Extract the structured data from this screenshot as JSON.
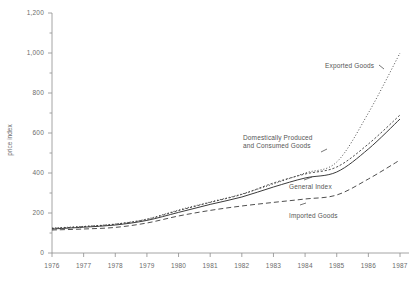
{
  "chart_data": {
    "type": "line",
    "title": "",
    "xlabel": "",
    "ylabel": "price index",
    "xlim": [
      1976,
      1987
    ],
    "ylim": [
      0,
      1200
    ],
    "grid": false,
    "legend_position": "inline-annotations",
    "x": [
      1976,
      1977,
      1978,
      1979,
      1980,
      1981,
      1982,
      1983,
      1984,
      1985,
      1986,
      1987
    ],
    "xtick_labels": [
      "1976",
      "1977",
      "1978",
      "1979",
      "1980",
      "1981",
      "1982",
      "1983",
      "1984",
      "1985",
      "1986",
      "1987"
    ],
    "ytick_labels": [
      "0",
      "200",
      "400",
      "600",
      "800",
      "1,000",
      "1,200"
    ],
    "ytick_values": [
      0,
      200,
      400,
      600,
      800,
      1000,
      1200
    ],
    "yminor_step": 100,
    "series": [
      {
        "name": "Exported Goods",
        "style": "dotted",
        "label_x": 1985.05,
        "label_y": 900,
        "values": [
          125,
          133,
          145,
          170,
          215,
          255,
          295,
          345,
          400,
          455,
          700,
          1000
        ]
      },
      {
        "name": "Domestically Produced and Consumed Goods",
        "style": "dashed-fine",
        "label_x": 1981.1,
        "label_y": 470,
        "values": [
          123,
          132,
          144,
          168,
          212,
          253,
          293,
          350,
          395,
          430,
          545,
          690
        ]
      },
      {
        "name": "General Index",
        "style": "solid",
        "label_x": 1982.6,
        "label_y": 315,
        "values": [
          120,
          129,
          140,
          163,
          203,
          243,
          280,
          330,
          375,
          405,
          520,
          670
        ]
      },
      {
        "name": "Imported Goods",
        "style": "dashed",
        "label_x": 1982.6,
        "label_y": 195,
        "values": [
          115,
          120,
          128,
          150,
          185,
          213,
          235,
          253,
          270,
          290,
          370,
          465
        ]
      }
    ],
    "annotations": [
      {
        "text_lines": [
          "Domestically Produced",
          "and Consumed Goods"
        ],
        "target_series": "Domestically Produced and Consumed Goods"
      },
      {
        "text_lines": [
          "Exported Goods"
        ],
        "target_series": "Exported Goods"
      },
      {
        "text_lines": [
          "General Index"
        ],
        "target_series": "General Index"
      },
      {
        "text_lines": [
          "Imported Goods"
        ],
        "target_series": "Imported Goods"
      }
    ]
  },
  "axis": {
    "y_title": "price index",
    "y_labels": [
      "1,200",
      "1,000",
      "800",
      "600",
      "400",
      "200",
      "0"
    ],
    "x_labels": [
      "1976",
      "1977",
      "1978",
      "1979",
      "1980",
      "1981",
      "1982",
      "1983",
      "1984",
      "1985",
      "1986",
      "1987"
    ]
  },
  "labels": {
    "exported_goods": "Exported Goods",
    "domestic_line1": "Domestically Produced",
    "domestic_line2": "and Consumed Goods",
    "general_index": "General Index",
    "imported_goods": "Imported Goods"
  },
  "colors": {
    "axis": "#8d8d8d",
    "line": "#3b3b3b",
    "text": "#6b6b6b"
  }
}
